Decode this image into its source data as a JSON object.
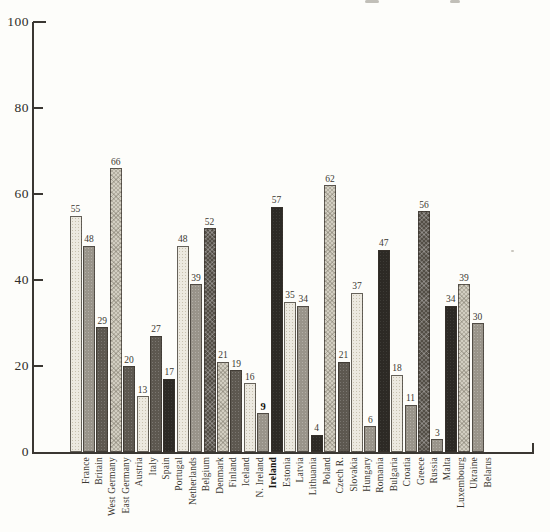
{
  "chart_data": {
    "type": "bar",
    "title": "",
    "xlabel": "",
    "ylabel": "",
    "ylim": [
      0,
      100
    ],
    "yticks": [
      0,
      20,
      40,
      60,
      80,
      100
    ],
    "grid": false,
    "legend": null,
    "categories": [
      "France",
      "Britain",
      "West Germany",
      "East Germany",
      "Austria",
      "Italy",
      "Spain",
      "Portugal",
      "Netherlands",
      "Belgium",
      "Denmark",
      "Finland",
      "Iceland",
      "N. Ireland",
      "Ireland",
      "Estonia",
      "Latvia",
      "Lithuania",
      "Poland",
      "Czech R.",
      "Slovakia",
      "Hungary",
      "Romania",
      "Bulgaria",
      "Croatia",
      "Greece",
      "Russia",
      "Malta",
      "Luxembourg",
      "Ukraine",
      "Belarus"
    ],
    "values": [
      55,
      48,
      29,
      66,
      20,
      13,
      27,
      17,
      48,
      39,
      52,
      21,
      19,
      16,
      9,
      57,
      35,
      34,
      4,
      62,
      21,
      37,
      6,
      47,
      18,
      11,
      56,
      3,
      34,
      39,
      30
    ],
    "value_labels": [
      "55",
      "48",
      "29",
      "66",
      "20",
      "13",
      "27",
      "17",
      "48",
      "39",
      "52",
      "21",
      "19",
      "16",
      "9",
      "57",
      "35",
      "34",
      "4",
      "62",
      "21",
      "37",
      "6",
      "47",
      "18",
      "11",
      "56",
      "3",
      "34",
      "39",
      "30"
    ],
    "emphasized_category": "Ireland",
    "bar_tones": [
      "light",
      "medium",
      "dark",
      "lightmed",
      "dark",
      "light",
      "dark",
      "black",
      "light",
      "medium",
      "crossdark",
      "lightmed",
      "dark",
      "light",
      "medium",
      "black",
      "light",
      "medium",
      "black",
      "lightmed",
      "dark",
      "light",
      "medium",
      "black",
      "light",
      "medium",
      "crossdark",
      "medium",
      "black",
      "lightmed",
      "medium"
    ],
    "palette": {
      "light": "#ece9e0",
      "lightmed": "#d2cec1",
      "medium": "#99948a",
      "dark": "#5d5850",
      "crossdark": "#534e46",
      "black": "#2d2a25"
    },
    "axis_color": "#3a3732",
    "label_color": "#3b3831",
    "background": "#fdfdfa"
  }
}
